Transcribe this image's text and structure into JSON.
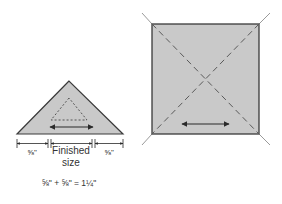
{
  "triangle_diagram": {
    "left_seam_label": "⅝\"",
    "center_label_line1": "Finished",
    "center_label_line2": "size",
    "right_seam_label": "⅝\"",
    "equation": "⅝\" + ⅝\" = 1¼\""
  },
  "square_diagram": {
    "description": "Square cut diagonally twice into quarter-square triangles, with grain arrow"
  },
  "colors": {
    "fill": "#c9c9c9",
    "outline": "#3a3a3a",
    "dash": "#5a5a5a",
    "extension": "#9a9a9a",
    "text": "#333333"
  }
}
